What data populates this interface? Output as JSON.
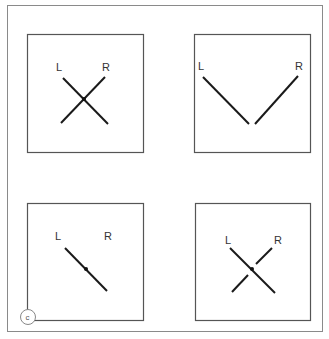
{
  "figure": {
    "panel_badge": "c",
    "panels": [
      {
        "id": "top-left",
        "left_label": "L",
        "right_label": "R",
        "description": "two lines crossing at center point (X)"
      },
      {
        "id": "top-right",
        "left_label": "L",
        "right_label": "R",
        "description": "two lines converging to bottom, not touching (V)"
      },
      {
        "id": "bottom-left",
        "left_label": "L",
        "right_label": "R",
        "description": "single diagonal line with center point"
      },
      {
        "id": "bottom-right",
        "left_label": "L",
        "right_label": "R",
        "description": "continuous L line crossing broken R line at center point"
      }
    ]
  },
  "colors": {
    "line": "#1a1a1a",
    "box": "#555555",
    "frame": "#8a8a8a"
  }
}
